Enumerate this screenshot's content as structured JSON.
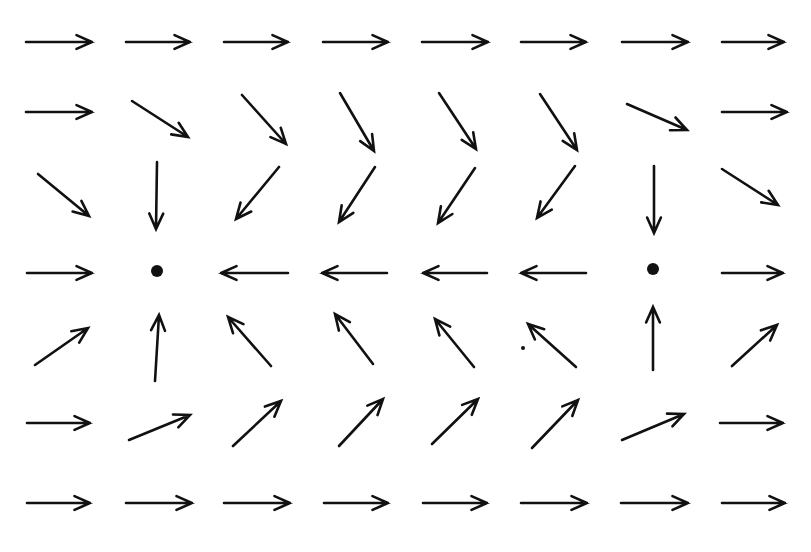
{
  "diagram": {
    "type": "vector-field",
    "colors": {
      "ink": "#111111",
      "background": "#ffffff"
    },
    "columns_x": [
      59,
      157,
      255,
      355,
      455,
      553,
      653,
      752
    ],
    "rows_y": [
      42,
      112,
      192,
      270,
      345,
      423,
      503
    ],
    "arrows": [
      {
        "x1": 26,
        "y1": 42,
        "x2": 92,
        "y2": 42
      },
      {
        "x1": 126,
        "y1": 42,
        "x2": 190,
        "y2": 42
      },
      {
        "x1": 224,
        "y1": 42,
        "x2": 288,
        "y2": 42
      },
      {
        "x1": 323,
        "y1": 42,
        "x2": 388,
        "y2": 42
      },
      {
        "x1": 422,
        "y1": 42,
        "x2": 488,
        "y2": 42
      },
      {
        "x1": 521,
        "y1": 42,
        "x2": 586,
        "y2": 42
      },
      {
        "x1": 622,
        "y1": 42,
        "x2": 688,
        "y2": 42
      },
      {
        "x1": 722,
        "y1": 42,
        "x2": 784,
        "y2": 42
      },
      {
        "x1": 26,
        "y1": 112,
        "x2": 92,
        "y2": 112
      },
      {
        "x1": 132,
        "y1": 101,
        "x2": 188,
        "y2": 137
      },
      {
        "x1": 242,
        "y1": 95,
        "x2": 286,
        "y2": 144
      },
      {
        "x1": 340,
        "y1": 93,
        "x2": 374,
        "y2": 151
      },
      {
        "x1": 439,
        "y1": 93,
        "x2": 476,
        "y2": 149
      },
      {
        "x1": 540,
        "y1": 94,
        "x2": 577,
        "y2": 150
      },
      {
        "x1": 627,
        "y1": 104,
        "x2": 687,
        "y2": 130
      },
      {
        "x1": 722,
        "y1": 112,
        "x2": 787,
        "y2": 112
      },
      {
        "x1": 38,
        "y1": 174,
        "x2": 89,
        "y2": 216
      },
      {
        "x1": 157,
        "y1": 162,
        "x2": 156,
        "y2": 229
      },
      {
        "x1": 279,
        "y1": 167,
        "x2": 236,
        "y2": 219
      },
      {
        "x1": 375,
        "y1": 167,
        "x2": 339,
        "y2": 222
      },
      {
        "x1": 475,
        "y1": 168,
        "x2": 438,
        "y2": 223
      },
      {
        "x1": 575,
        "y1": 166,
        "x2": 537,
        "y2": 218
      },
      {
        "x1": 654,
        "y1": 166,
        "x2": 654,
        "y2": 233
      },
      {
        "x1": 722,
        "y1": 169,
        "x2": 778,
        "y2": 205
      },
      {
        "x1": 27,
        "y1": 273,
        "x2": 92,
        "y2": 273
      },
      {
        "dot": true,
        "x": 157,
        "y": 271
      },
      {
        "x1": 288,
        "y1": 273,
        "x2": 221,
        "y2": 273
      },
      {
        "x1": 387,
        "y1": 273,
        "x2": 322,
        "y2": 273
      },
      {
        "x1": 487,
        "y1": 273,
        "x2": 423,
        "y2": 273
      },
      {
        "x1": 586,
        "y1": 273,
        "x2": 521,
        "y2": 273
      },
      {
        "dot": true,
        "x": 653,
        "y": 269
      },
      {
        "x1": 722,
        "y1": 273,
        "x2": 783,
        "y2": 273
      },
      {
        "x1": 35,
        "y1": 365,
        "x2": 88,
        "y2": 328
      },
      {
        "x1": 155,
        "y1": 381,
        "x2": 159,
        "y2": 315
      },
      {
        "x1": 271,
        "y1": 366,
        "x2": 228,
        "y2": 317
      },
      {
        "x1": 373,
        "y1": 364,
        "x2": 335,
        "y2": 314
      },
      {
        "x1": 474,
        "y1": 367,
        "x2": 435,
        "y2": 319
      },
      {
        "x1": 576,
        "y1": 367,
        "x2": 528,
        "y2": 324
      },
      {
        "x1": 653,
        "y1": 370,
        "x2": 653,
        "y2": 307
      },
      {
        "x1": 732,
        "y1": 366,
        "x2": 777,
        "y2": 325
      },
      {
        "x1": 27,
        "y1": 423,
        "x2": 90,
        "y2": 423
      },
      {
        "x1": 129,
        "y1": 440,
        "x2": 190,
        "y2": 415
      },
      {
        "x1": 233,
        "y1": 446,
        "x2": 281,
        "y2": 401
      },
      {
        "x1": 339,
        "y1": 446,
        "x2": 383,
        "y2": 399
      },
      {
        "x1": 432,
        "y1": 444,
        "x2": 478,
        "y2": 399
      },
      {
        "x1": 532,
        "y1": 448,
        "x2": 578,
        "y2": 400
      },
      {
        "x1": 622,
        "y1": 440,
        "x2": 684,
        "y2": 414
      },
      {
        "x1": 720,
        "y1": 423,
        "x2": 783,
        "y2": 423
      },
      {
        "x1": 27,
        "y1": 503,
        "x2": 90,
        "y2": 503
      },
      {
        "x1": 126,
        "y1": 503,
        "x2": 192,
        "y2": 503
      },
      {
        "x1": 224,
        "y1": 503,
        "x2": 290,
        "y2": 503
      },
      {
        "x1": 324,
        "y1": 503,
        "x2": 388,
        "y2": 503
      },
      {
        "x1": 423,
        "y1": 503,
        "x2": 487,
        "y2": 503
      },
      {
        "x1": 521,
        "y1": 503,
        "x2": 587,
        "y2": 503
      },
      {
        "x1": 621,
        "y1": 503,
        "x2": 688,
        "y2": 503
      },
      {
        "x1": 722,
        "y1": 503,
        "x2": 785,
        "y2": 503
      }
    ],
    "stray_marks": [
      {
        "x": 523,
        "y": 348,
        "r": 2
      }
    ],
    "sinks": [
      {
        "x": 157,
        "y": 271
      },
      {
        "x": 653,
        "y": 269
      }
    ]
  }
}
